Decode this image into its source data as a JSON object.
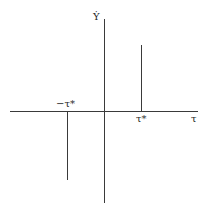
{
  "diagram": {
    "y_axis_label": "Ẏ",
    "x_axis_label": "τ",
    "neg_tick_label": "−τ*",
    "pos_tick_label": "τ*",
    "line_color": "#3a3a3a",
    "spikes": [
      {
        "position": "-τ*",
        "direction": "down"
      },
      {
        "position": "τ*",
        "direction": "up"
      }
    ]
  }
}
